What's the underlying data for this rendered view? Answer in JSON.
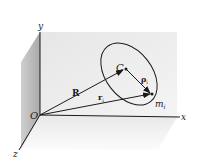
{
  "diagram": {
    "title": "",
    "axes": {
      "x_label": "x",
      "y_label": "y",
      "z_label": "z"
    },
    "points": {
      "origin": "O",
      "center_of_mass": "C",
      "particle_main": "m",
      "particle_sub": "i"
    },
    "vectors": {
      "R": "R",
      "r_main": "r",
      "r_sub": "i",
      "rho_main": "ρ",
      "rho_sub": "i"
    },
    "colors": {
      "ink": "#1a1a1a",
      "back_wall": "#ececec",
      "side_wall": "#b8b8b8",
      "floor": "#f3f3f3"
    }
  }
}
